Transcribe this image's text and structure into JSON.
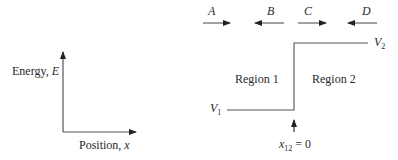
{
  "left_panel": {
    "y_axis_label": "Energy, ",
    "y_axis_symbol": "E",
    "x_axis_label": "Position, ",
    "x_axis_symbol": "x"
  },
  "right_panel": {
    "wave_labels": [
      {
        "label": "A",
        "direction": "right"
      },
      {
        "label": "B",
        "direction": "left"
      },
      {
        "label": "C",
        "direction": "right"
      },
      {
        "label": "D",
        "direction": "left"
      }
    ],
    "region_1": "Region 1",
    "region_2": "Region 2",
    "v1": {
      "symbol": "V",
      "sub": "1"
    },
    "v2": {
      "symbol": "V",
      "sub": "2"
    },
    "boundary": {
      "symbol": "x",
      "sub": "12",
      "value": " = 0"
    }
  },
  "colors": {
    "line": "#555555",
    "arrow": "#222222",
    "text": "#2a2a2a"
  }
}
